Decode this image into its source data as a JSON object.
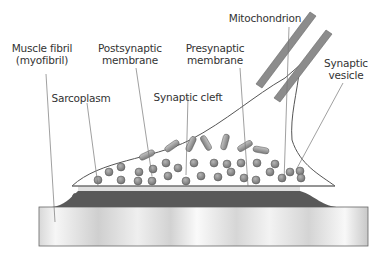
{
  "labels": {
    "muscle_fibril": {
      "line1": "Muscle fibril",
      "line2": "(myofibril)"
    },
    "postsynaptic": {
      "line1": "Postsynaptic",
      "line2": "membrane"
    },
    "presynaptic": {
      "line1": "Presynaptic",
      "line2": "membrane"
    },
    "mitochondrion": "Mitochondrion",
    "synaptic_vesicle": {
      "line1": "Synaptic",
      "line2": "vesicle"
    },
    "sarcoplasm": "Sarcoplasm",
    "synaptic_cleft": "Synaptic cleft"
  },
  "colors": {
    "text": "#333333",
    "leader_line": "#777777",
    "axon_sheath": "#888888",
    "sarcoplasm": "#555555",
    "cleft": "#e4e4e4",
    "vesicle": "#8a8a8a",
    "mitochondria": "#9a9a9a"
  }
}
